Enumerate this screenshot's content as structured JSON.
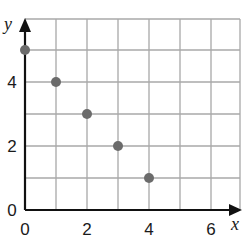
{
  "chart_data": {
    "type": "scatter",
    "title": "",
    "xlabel": "x",
    "ylabel": "y",
    "xlim": [
      0,
      7
    ],
    "ylim": [
      0,
      6
    ],
    "grid": true,
    "x_ticks": [
      "0",
      "2",
      "4",
      "6"
    ],
    "y_ticks": [
      "0",
      "2",
      "4"
    ],
    "series": [
      {
        "name": "points",
        "x": [
          0,
          1,
          2,
          3,
          4
        ],
        "y": [
          5,
          4,
          3,
          2,
          1
        ]
      }
    ],
    "colors": {
      "grid": "#a8a8a8",
      "axis": "#111111",
      "point": "#6b6b6b"
    }
  }
}
